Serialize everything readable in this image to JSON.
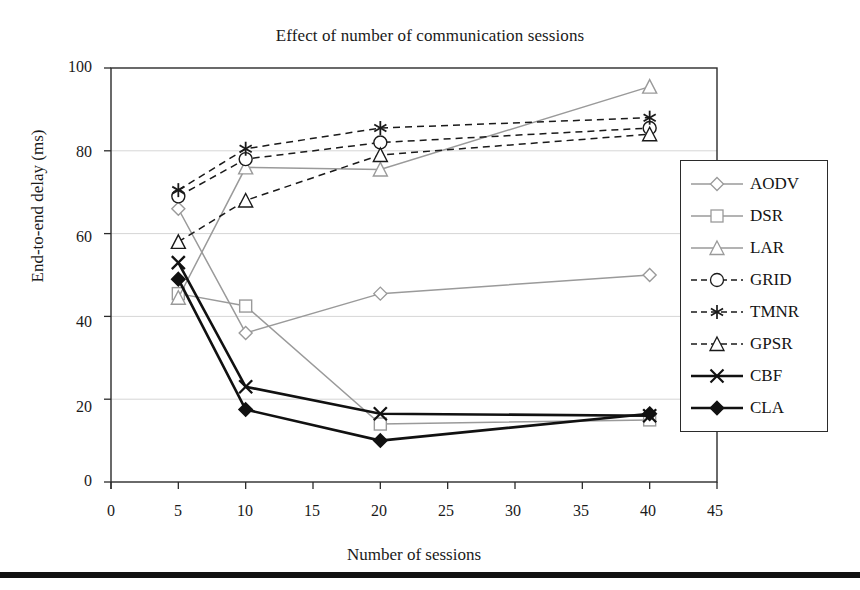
{
  "chart_data": {
    "type": "line",
    "title": "Effect of number of communication sessions",
    "xlabel": "Number of sessions",
    "ylabel": "End-to-end delay (ms)",
    "x": [
      5,
      10,
      20,
      40
    ],
    "xlim": [
      0,
      45
    ],
    "ylim": [
      0,
      100
    ],
    "xticks": [
      "0",
      "5",
      "10",
      "15",
      "20",
      "25",
      "30",
      "35",
      "40",
      "45"
    ],
    "yticks": [
      "0",
      "20",
      "40",
      "60",
      "80",
      "100"
    ],
    "grid": "horizontal",
    "legend_position": "right",
    "series": [
      {
        "name": "AODV",
        "values": [
          66,
          36,
          45.5,
          50
        ],
        "color": "#9a9a9a",
        "style": "solid",
        "marker": "diamond-open"
      },
      {
        "name": "DSR",
        "values": [
          45.5,
          42.5,
          14,
          15
        ],
        "color": "#9a9a9a",
        "style": "solid",
        "marker": "square-open"
      },
      {
        "name": "LAR",
        "values": [
          44.5,
          76,
          75.5,
          95.5
        ],
        "color": "#9a9a9a",
        "style": "solid",
        "marker": "triangle-open"
      },
      {
        "name": "GRID",
        "values": [
          69,
          78,
          82,
          85.5
        ],
        "color": "#1a1a1a",
        "style": "dashed",
        "marker": "circle-open"
      },
      {
        "name": "TMNR",
        "values": [
          70.5,
          80.5,
          85.5,
          88
        ],
        "color": "#1a1a1a",
        "style": "dashed",
        "marker": "asterisk"
      },
      {
        "name": "GPSR",
        "values": [
          58,
          68,
          79,
          84
        ],
        "color": "#1a1a1a",
        "style": "dashed",
        "marker": "triangle-open"
      },
      {
        "name": "CBF",
        "values": [
          53,
          23,
          16.5,
          16
        ],
        "color": "#111111",
        "style": "solid",
        "marker": "x"
      },
      {
        "name": "CLA",
        "values": [
          49,
          17.5,
          10,
          16.5
        ],
        "color": "#111111",
        "style": "solid",
        "marker": "diamond-filled"
      }
    ]
  },
  "axis": {
    "x_tick_labels": [
      "0",
      "5",
      "10",
      "15",
      "20",
      "25",
      "30",
      "35",
      "40",
      "45"
    ],
    "y_tick_labels": [
      "100",
      "80",
      "60",
      "40",
      "20",
      "0"
    ]
  },
  "legend": {
    "items": [
      {
        "label": "AODV"
      },
      {
        "label": "DSR"
      },
      {
        "label": "LAR"
      },
      {
        "label": "GRID"
      },
      {
        "label": "TMNR"
      },
      {
        "label": "GPSR"
      },
      {
        "label": "CBF"
      },
      {
        "label": "CLA"
      }
    ]
  },
  "colors": {
    "gray_series": "#9a9a9a",
    "black_series": "#111111",
    "grid": "#d6d6d6",
    "frame": "#2b2b2b"
  }
}
